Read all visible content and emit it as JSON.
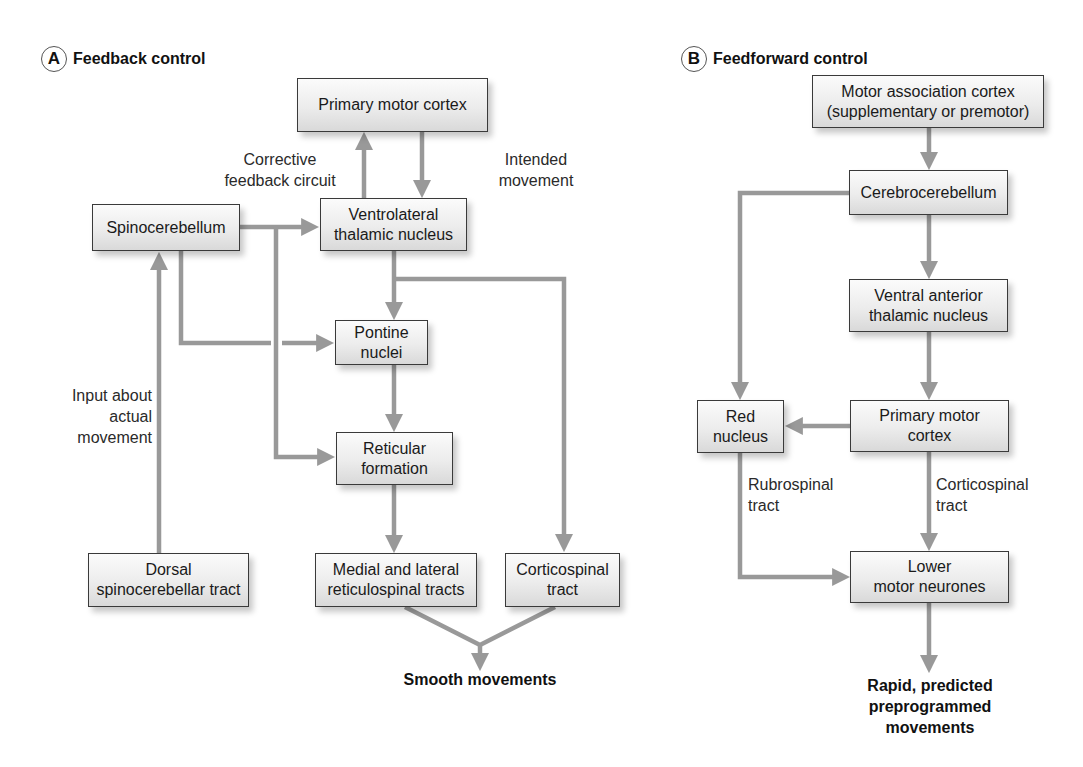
{
  "colors": {
    "arrow": "#999999",
    "box_border": "#3a3a3a",
    "box_fill_top": "#fbfbfb",
    "box_fill_bottom": "#d9d9d9",
    "text": "#1a1a1a"
  },
  "panel_a": {
    "badge": "A",
    "title": "Feedback control",
    "boxes": {
      "primary_motor_cortex": "Primary motor cortex",
      "ventrolateral_thalamic_nucleus": "Ventrolateral\nthalamic nucleus",
      "spinocerebellum": "Spinocerebellum",
      "pontine_nuclei": "Pontine nuclei",
      "reticular_formation": "Reticular\nformation",
      "reticulospinal_tracts": "Medial and lateral\nreticulospinal tracts",
      "corticospinal_tract": "Corticospinal\ntract",
      "dorsal_spinocerebellar_tract": "Dorsal\nspinocerebellar tract"
    },
    "labels": {
      "corrective_feedback": "Corrective\nfeedback circuit",
      "intended_movement": "Intended\nmovement",
      "input_actual_movement": "Input about\nactual\nmovement"
    },
    "output": "Smooth movements"
  },
  "panel_b": {
    "badge": "B",
    "title": "Feedforward control",
    "boxes": {
      "motor_association_cortex": "Motor association cortex\n(supplementary or premotor)",
      "cerebrocerebellum": "Cerebrocerebellum",
      "ventral_anterior_thalamic_nucleus": "Ventral anterior\nthalamic nucleus",
      "red_nucleus": "Red\nnucleus",
      "primary_motor_cortex": "Primary motor\ncortex",
      "lower_motor_neurones": "Lower\nmotor neurones"
    },
    "labels": {
      "rubrospinal_tract": "Rubrospinal\ntract",
      "corticospinal_tract": "Corticospinal\ntract"
    },
    "output": "Rapid, predicted\npreprogrammed\nmovements"
  }
}
